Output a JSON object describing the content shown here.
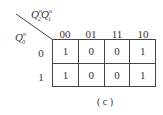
{
  "kmap": {
    "col_var_label": {
      "main1": "Q",
      "sub1": "2",
      "sup1": "n",
      "main2": "Q",
      "sub2": "1",
      "sup2": "n"
    },
    "row_var_label": {
      "main": "Q",
      "sub": "0",
      "sup": "n"
    },
    "col_headers": [
      "00",
      "01",
      "11",
      "10"
    ],
    "row_headers": [
      "0",
      "1"
    ],
    "cells": [
      [
        "1",
        "0",
        "0",
        "1"
      ],
      [
        "1",
        "0",
        "0",
        "1"
      ]
    ],
    "caption": "( c )"
  }
}
